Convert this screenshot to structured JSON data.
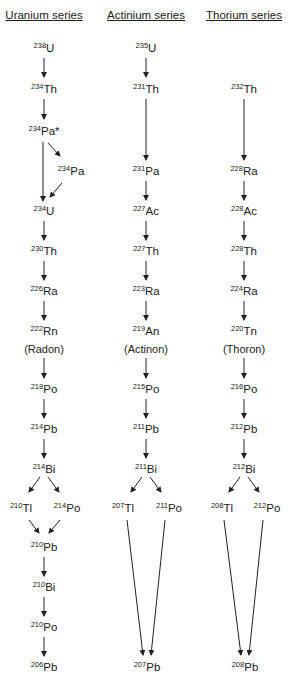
{
  "series": [
    {
      "title": "Uranium series",
      "x": 44,
      "nuclides": [
        {
          "mass": "238",
          "symbol": "U",
          "x": 44,
          "y": 49
        },
        {
          "mass": "234",
          "symbol": "Th",
          "x": 44,
          "y": 90
        },
        {
          "mass": "234",
          "symbol": "Pa*",
          "x": 44,
          "y": 132
        },
        {
          "mass": "234",
          "symbol": "Pa",
          "x": 71,
          "y": 172
        },
        {
          "mass": "234",
          "symbol": "U",
          "x": 44,
          "y": 212
        },
        {
          "mass": "230",
          "symbol": "Th",
          "x": 44,
          "y": 252
        },
        {
          "mass": "226",
          "symbol": "Ra",
          "x": 44,
          "y": 292
        },
        {
          "mass": "222",
          "symbol": "Rn",
          "x": 44,
          "y": 332
        },
        {
          "mass": "218",
          "symbol": "Po",
          "x": 44,
          "y": 390
        },
        {
          "mass": "214",
          "symbol": "Pb",
          "x": 44,
          "y": 430
        },
        {
          "mass": "214",
          "symbol": "Bi",
          "x": 44,
          "y": 470
        },
        {
          "mass": "210",
          "symbol": "Tl",
          "x": 21,
          "y": 509
        },
        {
          "mass": "214",
          "symbol": "Po",
          "x": 67,
          "y": 509
        },
        {
          "mass": "210",
          "symbol": "Pb",
          "x": 44,
          "y": 548
        },
        {
          "mass": "210",
          "symbol": "Bi",
          "x": 44,
          "y": 588
        },
        {
          "mass": "210",
          "symbol": "Po",
          "x": 44,
          "y": 628
        },
        {
          "mass": "206",
          "symbol": "Pb",
          "x": 44,
          "y": 668
        }
      ],
      "note": {
        "text": "(Radon)",
        "x": 44,
        "y": 349
      }
    },
    {
      "title": "Actinium series",
      "x": 146,
      "nuclides": [
        {
          "mass": "235",
          "symbol": "U",
          "x": 146,
          "y": 49
        },
        {
          "mass": "231",
          "symbol": "Th",
          "x": 146,
          "y": 90
        },
        {
          "mass": "231",
          "symbol": "Pa",
          "x": 146,
          "y": 172
        },
        {
          "mass": "227",
          "symbol": "Ac",
          "x": 146,
          "y": 212
        },
        {
          "mass": "227",
          "symbol": "Th",
          "x": 146,
          "y": 252
        },
        {
          "mass": "223",
          "symbol": "Ra",
          "x": 146,
          "y": 292
        },
        {
          "mass": "219",
          "symbol": "An",
          "x": 146,
          "y": 332
        },
        {
          "mass": "215",
          "symbol": "Po",
          "x": 146,
          "y": 390
        },
        {
          "mass": "211",
          "symbol": "Pb",
          "x": 146,
          "y": 430
        },
        {
          "mass": "211",
          "symbol": "Bi",
          "x": 146,
          "y": 470
        },
        {
          "mass": "207",
          "symbol": "Tl",
          "x": 123,
          "y": 509
        },
        {
          "mass": "211",
          "symbol": "Po",
          "x": 169,
          "y": 509
        },
        {
          "mass": "207",
          "symbol": "Pb",
          "x": 147,
          "y": 668
        }
      ],
      "note": {
        "text": "(Actinon)",
        "x": 146,
        "y": 349
      }
    },
    {
      "title": "Thorium series",
      "x": 244,
      "nuclides": [
        {
          "mass": "232",
          "symbol": "Th",
          "x": 244,
          "y": 90
        },
        {
          "mass": "228",
          "symbol": "Ra",
          "x": 244,
          "y": 172
        },
        {
          "mass": "228",
          "symbol": "Ac",
          "x": 244,
          "y": 212
        },
        {
          "mass": "228",
          "symbol": "Th",
          "x": 244,
          "y": 252
        },
        {
          "mass": "224",
          "symbol": "Ra",
          "x": 244,
          "y": 292
        },
        {
          "mass": "220",
          "symbol": "Tn",
          "x": 244,
          "y": 332
        },
        {
          "mass": "216",
          "symbol": "Po",
          "x": 244,
          "y": 390
        },
        {
          "mass": "212",
          "symbol": "Pb",
          "x": 244,
          "y": 430
        },
        {
          "mass": "212",
          "symbol": "Bi",
          "x": 244,
          "y": 470
        },
        {
          "mass": "208",
          "symbol": "Tl",
          "x": 222,
          "y": 509
        },
        {
          "mass": "212",
          "symbol": "Po",
          "x": 267,
          "y": 509
        },
        {
          "mass": "208",
          "symbol": "Pb",
          "x": 245,
          "y": 668
        }
      ],
      "note": {
        "text": "(Thoron)",
        "x": 244,
        "y": 349
      }
    }
  ],
  "arrows": [
    [
      44,
      58,
      44,
      77
    ],
    [
      44,
      99,
      44,
      119
    ],
    [
      43,
      142,
      43,
      201
    ],
    [
      48,
      143,
      60,
      156
    ],
    [
      62,
      183,
      50,
      197
    ],
    [
      44,
      221,
      44,
      240
    ],
    [
      44,
      261,
      44,
      280
    ],
    [
      44,
      301,
      44,
      320
    ],
    [
      44,
      358,
      44,
      378
    ],
    [
      44,
      399,
      44,
      418
    ],
    [
      44,
      439,
      44,
      458
    ],
    [
      40,
      477,
      29,
      492
    ],
    [
      48,
      477,
      59,
      492
    ],
    [
      29,
      520,
      39,
      533
    ],
    [
      60,
      520,
      49,
      533
    ],
    [
      44,
      557,
      44,
      576
    ],
    [
      44,
      597,
      44,
      616
    ],
    [
      44,
      637,
      44,
      656
    ],
    [
      146,
      58,
      146,
      77
    ],
    [
      146,
      99,
      146,
      160
    ],
    [
      146,
      181,
      146,
      200
    ],
    [
      146,
      221,
      146,
      240
    ],
    [
      146,
      261,
      146,
      280
    ],
    [
      146,
      301,
      146,
      320
    ],
    [
      146,
      358,
      146,
      378
    ],
    [
      146,
      399,
      146,
      418
    ],
    [
      146,
      439,
      146,
      458
    ],
    [
      142,
      477,
      131,
      492
    ],
    [
      150,
      477,
      161,
      492
    ],
    [
      127,
      520,
      143,
      655
    ],
    [
      165,
      520,
      151,
      655
    ],
    [
      244,
      99,
      244,
      160
    ],
    [
      244,
      181,
      244,
      200
    ],
    [
      244,
      221,
      244,
      240
    ],
    [
      244,
      261,
      244,
      280
    ],
    [
      244,
      301,
      244,
      320
    ],
    [
      244,
      358,
      244,
      378
    ],
    [
      244,
      399,
      244,
      418
    ],
    [
      244,
      439,
      244,
      458
    ],
    [
      240,
      477,
      229,
      492
    ],
    [
      248,
      477,
      259,
      492
    ],
    [
      224,
      520,
      241,
      655
    ],
    [
      263,
      520,
      249,
      655
    ]
  ]
}
